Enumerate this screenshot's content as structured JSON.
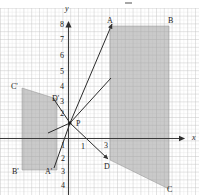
{
  "figure": {
    "background_color": "#ffffff",
    "grid": {
      "minor_color": "#d9d9d9",
      "major_color": "#bdbdbd",
      "minor_step_px": 3.9,
      "major_every": 2,
      "shown": true
    },
    "axes": {
      "color": "#3a3a3a",
      "x_axis_label": "x",
      "y_axis_label": "y",
      "origin_px": {
        "x": 68.5,
        "y": 138.5
      },
      "unit_px": 7.8,
      "x_arrow": true,
      "y_arrow": true
    },
    "y_ticks": [
      {
        "label": "8",
        "value": 8
      },
      {
        "label": "7",
        "value": 7
      },
      {
        "label": "6",
        "value": 6
      },
      {
        "label": "5",
        "value": 5
      },
      {
        "label": "4",
        "value": 4
      },
      {
        "label": "3",
        "value": 3
      },
      {
        "label": "2",
        "value": 2
      },
      {
        "label": "1",
        "value": -1
      },
      {
        "label": "2",
        "value": -2
      },
      {
        "label": "3",
        "value": -3
      },
      {
        "label": "4",
        "value": -4
      }
    ],
    "x_ticks": [
      {
        "label": "1",
        "value": 1
      },
      {
        "label": "3",
        "value": 3
      }
    ],
    "shapes": [
      {
        "name": "quadrilateral-ABCD",
        "fill": "#9e9e9e",
        "opacity": 0.62,
        "vertices": [
          {
            "label": "A",
            "px": {
              "x": 110,
              "y": 26
            }
          },
          {
            "label": "B",
            "px": {
              "x": 169,
              "y": 26
            }
          },
          {
            "label": "C",
            "px": {
              "x": 169,
              "y": 189
            }
          },
          {
            "label": "D",
            "px": {
              "x": 110,
              "y": 160
            }
          }
        ]
      },
      {
        "name": "quadrilateral-A-prime-B-prime-C-prime-D-prime",
        "fill": "#9e9e9e",
        "opacity": 0.62,
        "vertices": [
          {
            "label": "C'",
            "px": {
              "x": 22,
              "y": 88
            }
          },
          {
            "label": "D'",
            "px": {
              "x": 57,
              "y": 99
            }
          },
          {
            "label": "A'",
            "px": {
              "x": 57,
              "y": 170
            }
          },
          {
            "label": "B'",
            "px": {
              "x": 22,
              "y": 170
            }
          }
        ]
      }
    ],
    "center_point": {
      "label": "P",
      "px": {
        "x": 70,
        "y": 123
      }
    },
    "rays": [
      {
        "name": "ray-P-to-A",
        "from_label": "P",
        "to_label": "A",
        "arrow": true
      },
      {
        "name": "ray-P-to-B",
        "from_label": "P",
        "to_label": "B",
        "arrow": false
      },
      {
        "name": "ray-P-to-D",
        "from_label": "P",
        "to_label": "D",
        "arrow": true
      },
      {
        "name": "ray-P-to-A-prime",
        "from_label": "P",
        "to_label": "A'",
        "arrow": false
      },
      {
        "name": "ray-P-to-D-prime",
        "from_label": "P",
        "to_label": "D'",
        "arrow": false
      },
      {
        "name": "ray-P-to-C-prime",
        "from_label": "P",
        "to_label": "C'",
        "arrow": false
      }
    ],
    "point_labels": [
      {
        "id": "A",
        "text": "A",
        "px": {
          "x": 107,
          "y": 17
        }
      },
      {
        "id": "B",
        "text": "B",
        "px": {
          "x": 168,
          "y": 17
        }
      },
      {
        "id": "C",
        "text": "C",
        "px": {
          "x": 167,
          "y": 186
        }
      },
      {
        "id": "D",
        "text": "D",
        "px": {
          "x": 104,
          "y": 163
        }
      },
      {
        "id": "Aprime",
        "text": "A'",
        "px": {
          "x": 45,
          "y": 168
        }
      },
      {
        "id": "Bprime",
        "text": "B'",
        "px": {
          "x": 12,
          "y": 168
        }
      },
      {
        "id": "Cprime",
        "text": "C'",
        "px": {
          "x": 11,
          "y": 83
        }
      },
      {
        "id": "Dprime",
        "text": "D'",
        "px": {
          "x": 52,
          "y": 95
        }
      },
      {
        "id": "P",
        "text": "P",
        "px": {
          "x": 76,
          "y": 120
        }
      }
    ]
  }
}
